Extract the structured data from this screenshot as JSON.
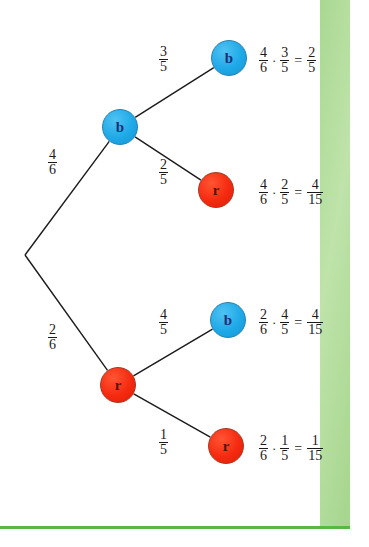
{
  "diagram": {
    "root": {
      "label": "",
      "x": 25,
      "y": 255
    },
    "colors": {
      "blue_node": "#1fa9e8",
      "red_node": "#f52a10",
      "blue_letter": "#15307a",
      "red_letter": "#5a1204",
      "branch_line": "#1a1a1a",
      "accent_green_band": "#b3dd9b",
      "accent_green_rule": "#5cb646",
      "page_background": "#ffffff"
    },
    "nodes": [
      {
        "id": "level1-b",
        "label": "b",
        "color": "blue",
        "x": 120,
        "y": 127
      },
      {
        "id": "level1-r",
        "label": "r",
        "color": "red",
        "x": 118,
        "y": 385
      },
      {
        "id": "leaf-bb",
        "label": "b",
        "color": "blue",
        "x": 229,
        "y": 58
      },
      {
        "id": "leaf-br",
        "label": "r",
        "color": "red",
        "x": 216,
        "y": 190
      },
      {
        "id": "leaf-rb",
        "label": "b",
        "color": "blue",
        "x": 228,
        "y": 320
      },
      {
        "id": "leaf-rr",
        "label": "r",
        "color": "red",
        "x": 226,
        "y": 446
      }
    ],
    "branches": [
      {
        "id": "root-to-b",
        "from": "root",
        "to": "level1-b",
        "numerator": "4",
        "denominator": "6",
        "label_x": 47,
        "label_y": 148
      },
      {
        "id": "root-to-r",
        "from": "root",
        "to": "level1-r",
        "numerator": "2",
        "denominator": "6",
        "label_x": 47,
        "label_y": 323
      },
      {
        "id": "b-to-b",
        "from": "level1-b",
        "to": "leaf-bb",
        "numerator": "3",
        "denominator": "5",
        "label_x": 158,
        "label_y": 45
      },
      {
        "id": "b-to-r",
        "from": "level1-b",
        "to": "leaf-br",
        "numerator": "2",
        "denominator": "5",
        "label_x": 158,
        "label_y": 158
      },
      {
        "id": "r-to-b",
        "from": "level1-r",
        "to": "leaf-rb",
        "numerator": "4",
        "denominator": "5",
        "label_x": 158,
        "label_y": 308
      },
      {
        "id": "r-to-r",
        "from": "level1-r",
        "to": "leaf-rr",
        "numerator": "1",
        "denominator": "5",
        "label_x": 158,
        "label_y": 428
      }
    ],
    "results": [
      {
        "id": "result-bb",
        "x": 258,
        "y": 46,
        "first": {
          "numerator": "4",
          "denominator": "6"
        },
        "operator": "·",
        "second": {
          "numerator": "3",
          "denominator": "5"
        },
        "equals": "=",
        "product": {
          "numerator": "2",
          "denominator": "5"
        }
      },
      {
        "id": "result-br",
        "x": 258,
        "y": 178,
        "first": {
          "numerator": "4",
          "denominator": "6"
        },
        "operator": "·",
        "second": {
          "numerator": "2",
          "denominator": "5"
        },
        "equals": "=",
        "product": {
          "numerator": "4",
          "denominator": "15"
        }
      },
      {
        "id": "result-rb",
        "x": 258,
        "y": 308,
        "first": {
          "numerator": "2",
          "denominator": "6"
        },
        "operator": "·",
        "second": {
          "numerator": "4",
          "denominator": "5"
        },
        "equals": "=",
        "product": {
          "numerator": "4",
          "denominator": "15"
        }
      },
      {
        "id": "result-rr",
        "x": 258,
        "y": 434,
        "first": {
          "numerator": "2",
          "denominator": "6"
        },
        "operator": "·",
        "second": {
          "numerator": "1",
          "denominator": "5"
        },
        "equals": "=",
        "product": {
          "numerator": "1",
          "denominator": "15"
        }
      }
    ]
  }
}
